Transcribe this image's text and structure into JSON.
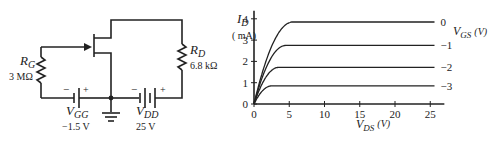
{
  "circuit": {
    "rg_label": "R",
    "rg_sub": "G",
    "rg_value": "3 MΩ",
    "rd_label": "R",
    "rd_sub": "D",
    "rd_value": "6.8 kΩ",
    "vgg_label": "V",
    "vgg_sub": "GG",
    "vgg_value": "−1.5 V",
    "vdd_label": "V",
    "vdd_sub": "DD",
    "vdd_value": "25 V",
    "minus": "−",
    "plus": "+"
  },
  "chart_data": {
    "type": "line",
    "title": "",
    "ylabel_main": "I",
    "ylabel_sub": "D",
    "ylabel_unit": "( mA)",
    "xlabel_main": "V",
    "xlabel_sub": "DS",
    "xlabel_unit": "(V)",
    "legend_main": "V",
    "legend_sub": "GS",
    "legend_unit": "(V)",
    "xlim": [
      0,
      27
    ],
    "ylim": [
      0,
      4
    ],
    "xticks": [
      0,
      5,
      10,
      15,
      20,
      25
    ],
    "xtick_labels": [
      "0",
      "5",
      "10",
      "15",
      "20",
      "25"
    ],
    "yticks": [
      0,
      1,
      2,
      3,
      4
    ],
    "ytick_labels": [
      "0",
      "1",
      "2",
      "3",
      "4"
    ],
    "grid": false,
    "series": [
      {
        "name": "0",
        "saturation_current": 3.85,
        "pinch_off_vds": 5.5
      },
      {
        "name": "-1",
        "saturation_current": 2.75,
        "pinch_off_vds": 4.5
      },
      {
        "name": "-2",
        "saturation_current": 1.72,
        "pinch_off_vds": 3.5
      },
      {
        "name": "-3",
        "saturation_current": 0.85,
        "pinch_off_vds": 2.5
      }
    ]
  }
}
